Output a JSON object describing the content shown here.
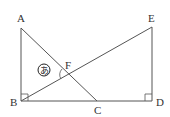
{
  "diagram": {
    "points": {
      "A": {
        "label": "A",
        "x": 21,
        "y": 28
      },
      "B": {
        "label": "B",
        "x": 21,
        "y": 101
      },
      "C": {
        "label": "C",
        "x": 97,
        "y": 101
      },
      "D": {
        "label": "D",
        "x": 152,
        "y": 101
      },
      "E": {
        "label": "E",
        "x": 152,
        "y": 27
      },
      "F": {
        "label": "F",
        "x": 68,
        "y": 75
      }
    },
    "angle_label": "あ",
    "stroke_color": "#555555"
  }
}
